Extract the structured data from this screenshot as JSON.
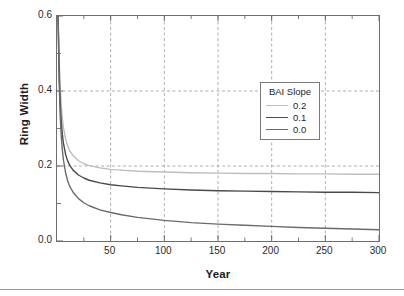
{
  "figure": {
    "width": 404,
    "height": 296,
    "background": "#ffffff",
    "frame_color": "#6e6e6e",
    "grid_color": "#9b9b9b"
  },
  "chart_data": {
    "type": "line",
    "title": "",
    "xlabel": "Year",
    "ylabel": "Ring Width",
    "xlim": [
      0,
      300
    ],
    "ylim": [
      0.0,
      0.6
    ],
    "xticks": [
      50,
      100,
      150,
      200,
      250,
      300
    ],
    "xtick_labels": [
      "50",
      "100",
      "150",
      "200",
      "250",
      "300"
    ],
    "xticks_minor": [
      25,
      75,
      125,
      175,
      225,
      275
    ],
    "yticks": [
      0.0,
      0.2,
      0.4,
      0.6
    ],
    "ytick_labels": [
      "0.0",
      "0.2",
      "0.4",
      "0.6"
    ],
    "yticks_minor": [
      0.1,
      0.3,
      0.5
    ],
    "grid": true,
    "grid_style": "dashed",
    "grid_x": [
      50,
      100,
      150,
      200,
      250
    ],
    "grid_y": [
      0.2,
      0.4
    ],
    "legend": {
      "title": "BAI Slope",
      "position": "upper right",
      "entries": [
        {
          "label": "0.2",
          "color": "#bdbdbd",
          "width": 1.4
        },
        {
          "label": "0.1",
          "color": "#4a4a4a",
          "width": 1.4
        },
        {
          "label": "0.0",
          "color": "#6b6b6b",
          "width": 1.4
        }
      ]
    },
    "series": [
      {
        "name": "0.2",
        "color": "#bdbdbd",
        "width": 1.4,
        "asymptote": 0.178,
        "x": [
          1,
          2,
          3,
          4,
          5,
          6,
          8,
          10,
          12,
          15,
          20,
          25,
          30,
          40,
          50,
          60,
          75,
          100,
          125,
          150,
          175,
          200,
          225,
          250,
          275,
          300
        ],
        "y": [
          0.6,
          0.485,
          0.41,
          0.36,
          0.326,
          0.303,
          0.272,
          0.253,
          0.24,
          0.228,
          0.214,
          0.206,
          0.201,
          0.195,
          0.191,
          0.189,
          0.186,
          0.184,
          0.182,
          0.181,
          0.18,
          0.18,
          0.179,
          0.179,
          0.178,
          0.178
        ]
      },
      {
        "name": "0.1",
        "color": "#4a4a4a",
        "width": 1.4,
        "asymptote": 0.129,
        "x": [
          1,
          2,
          3,
          4,
          5,
          6,
          8,
          10,
          12,
          15,
          20,
          25,
          30,
          40,
          50,
          60,
          75,
          100,
          125,
          150,
          175,
          200,
          225,
          250,
          275,
          300
        ],
        "y": [
          0.6,
          0.452,
          0.368,
          0.317,
          0.284,
          0.261,
          0.231,
          0.213,
          0.201,
          0.189,
          0.176,
          0.168,
          0.162,
          0.155,
          0.15,
          0.147,
          0.143,
          0.139,
          0.136,
          0.134,
          0.133,
          0.132,
          0.131,
          0.13,
          0.13,
          0.129
        ]
      },
      {
        "name": "0.0",
        "color": "#6b6b6b",
        "width": 1.4,
        "asymptote": 0.03,
        "x": [
          1,
          2,
          3,
          4,
          5,
          6,
          8,
          10,
          12,
          15,
          20,
          25,
          30,
          40,
          50,
          60,
          75,
          100,
          125,
          150,
          175,
          200,
          225,
          250,
          275,
          300
        ],
        "y": [
          0.6,
          0.424,
          0.332,
          0.278,
          0.242,
          0.216,
          0.182,
          0.16,
          0.145,
          0.13,
          0.113,
          0.102,
          0.094,
          0.083,
          0.076,
          0.07,
          0.063,
          0.055,
          0.049,
          0.045,
          0.042,
          0.039,
          0.036,
          0.034,
          0.032,
          0.03
        ]
      }
    ]
  }
}
